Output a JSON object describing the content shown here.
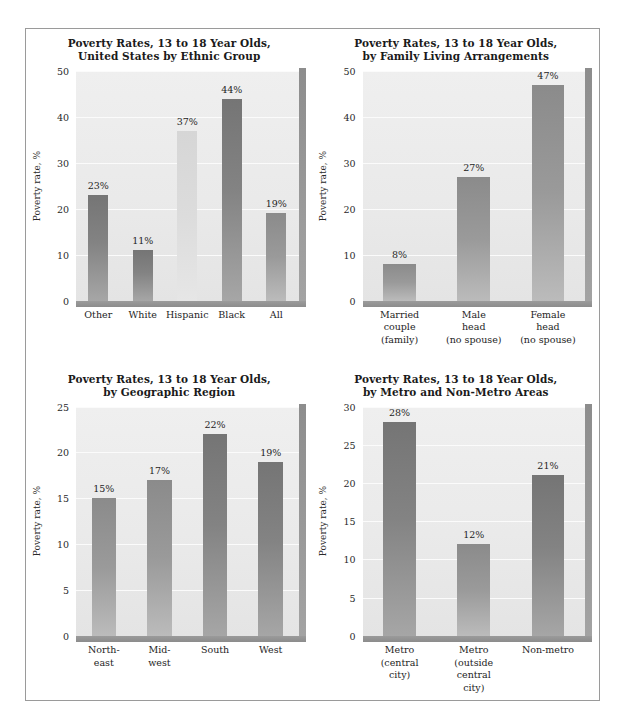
{
  "figure": {
    "background": "#ffffff",
    "frame_color": "#9a9a9a",
    "bar_dark": "#7a7a7a",
    "bar_mid": "#9a9a9a",
    "bar_light": "#d8d8d8",
    "plot_background": "#ececec",
    "gridline_color": "#fbfbfb"
  },
  "charts": [
    {
      "id": "ethnic-group",
      "title_line1": "Poverty Rates, 13 to 18 Year Olds,",
      "title_line2": "United States by Ethnic Group",
      "chart_data": {
        "type": "bar",
        "title": "Poverty Rates, 13 to 18 Year Olds, United States by Ethnic Group",
        "xlabel": "",
        "ylabel": "Poverty rate, %",
        "ylim": [
          0,
          50
        ],
        "yticks": [
          0,
          10,
          20,
          30,
          40,
          50
        ],
        "grid": true,
        "legend": "none",
        "categories": [
          "Other",
          "White",
          "Hispanic",
          "Black",
          "All"
        ],
        "values": [
          23,
          11,
          37,
          44,
          19
        ],
        "data_labels": [
          "23%",
          "11%",
          "37%",
          "44%",
          "19%"
        ],
        "bar_shades": [
          "dark",
          "dark",
          "light",
          "dark",
          "mid"
        ]
      }
    },
    {
      "id": "family-living-arrangements",
      "title_line1": "Poverty Rates, 13 to 18 Year Olds,",
      "title_line2": "by Family Living Arrangements",
      "chart_data": {
        "type": "bar",
        "title": "Poverty Rates, 13 to 18 Year Olds, by Family Living Arrangements",
        "xlabel": "",
        "ylabel": "Poverty rate, %",
        "ylim": [
          0,
          50
        ],
        "yticks": [
          0,
          10,
          20,
          30,
          40,
          50
        ],
        "grid": true,
        "legend": "none",
        "categories": [
          "Married\ncouple\n(family)",
          "Male\nhead\n(no spouse)",
          "Female\nhead\n(no spouse)"
        ],
        "values": [
          8,
          27,
          47
        ],
        "data_labels": [
          "8%",
          "27%",
          "47%"
        ],
        "bar_shades": [
          "mid",
          "mid",
          "mid"
        ]
      }
    },
    {
      "id": "geographic-region",
      "title_line1": "Poverty Rates, 13 to 18 Year Olds,",
      "title_line2": "by Geographic Region",
      "chart_data": {
        "type": "bar",
        "title": "Poverty Rates, 13 to 18 Year Olds, by Geographic Region",
        "xlabel": "",
        "ylabel": "Poverty rate, %",
        "ylim": [
          0,
          25
        ],
        "yticks": [
          0,
          5,
          10,
          15,
          20,
          25
        ],
        "grid": true,
        "legend": "none",
        "categories": [
          "North-\neast",
          "Mid-\nwest",
          "South",
          "West"
        ],
        "values": [
          15,
          17,
          22,
          19
        ],
        "data_labels": [
          "15%",
          "17%",
          "22%",
          "19%"
        ],
        "bar_shades": [
          "mid",
          "mid",
          "dark",
          "dark"
        ]
      }
    },
    {
      "id": "metro-non-metro",
      "title_line1": "Poverty Rates, 13 to 18 Year Olds,",
      "title_line2": "by Metro and Non-Metro Areas",
      "chart_data": {
        "type": "bar",
        "title": "Poverty Rates, 13 to 18 Year Olds, by Metro and Non-Metro Areas",
        "xlabel": "",
        "ylabel": "Poverty rate, %",
        "ylim": [
          0,
          30
        ],
        "yticks": [
          0,
          5,
          10,
          15,
          20,
          25,
          30
        ],
        "grid": true,
        "legend": "none",
        "categories": [
          "Metro\n(central\ncity)",
          "Metro\n(outside\ncentral\ncity)",
          "Non-metro"
        ],
        "values": [
          28,
          12,
          21
        ],
        "data_labels": [
          "28%",
          "12%",
          "21%"
        ],
        "bar_shades": [
          "dark",
          "mid",
          "dark"
        ]
      }
    }
  ]
}
